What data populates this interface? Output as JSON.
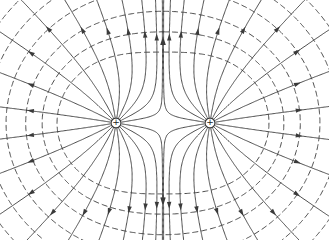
{
  "diagram": {
    "type": "electric-field-lines",
    "line_color": "#3a3a3a",
    "background": "#ffffff",
    "charges": [
      {
        "id": "left",
        "sign": "+",
        "x": 116,
        "y": 123
      },
      {
        "id": "right",
        "sign": "+",
        "x": 210,
        "y": 123
      }
    ],
    "field_lines": {
      "style": "solid",
      "arrows": "outward",
      "count_per_charge": 20
    },
    "equipotentials": {
      "style": "dashed"
    }
  }
}
